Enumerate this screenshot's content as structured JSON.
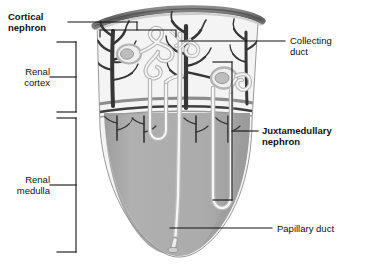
{
  "figure": {
    "type": "anatomical-cross-section"
  },
  "labels": {
    "cortical_nephron": "Cortical\nnephron",
    "renal_cortex": "Renal\ncortex",
    "renal_medulla": "Renal\nmedulla",
    "collecting_duct": "Collecting\nduct",
    "juxtamedullary_nephron": "Juxtamedullary\nnephron",
    "papillary_duct": "Papillary duct"
  },
  "colors": {
    "medulla_fill": "#a9a9a9",
    "medulla_shadow": "#8e8e8e",
    "cortex_fill": "#f2f2f2",
    "capsule": "#707070",
    "capsule_dark": "#5a5a5a",
    "tubule_stroke": "#b8b8b8",
    "tubule_fill": "#f6f6f6",
    "vessel_dark": "#3a3a3a",
    "leader_line": "#111111",
    "background": "#ffffff",
    "text": "#111111"
  },
  "structures": {
    "capsule": "renal-capsule-band",
    "cortex": "renal-cortex-zone",
    "medulla": "renal-medulla-pyramid",
    "cortical_nephron_glomerulus": "glomerulus-cortical",
    "juxtamedullary_glomerulus": "glomerulus-juxtamedullary",
    "loop_of_henle_short": "loop-of-henle-short",
    "loop_of_henle_long": "loop-of-henle-long",
    "collecting_duct": "collecting-duct-tubule",
    "papillary_duct": "papillary-duct-tubule",
    "arterial_tree": "renal-artery-branches",
    "corticomedullary_border": "corticomedullary-junction"
  },
  "brackets": {
    "cortical_nephron": "bracket-top-cortical",
    "renal_cortex": "bracket-left-cortex",
    "renal_medulla": "bracket-left-medulla",
    "juxtamedullary_nephron": "bracket-right-juxtamedullary"
  }
}
